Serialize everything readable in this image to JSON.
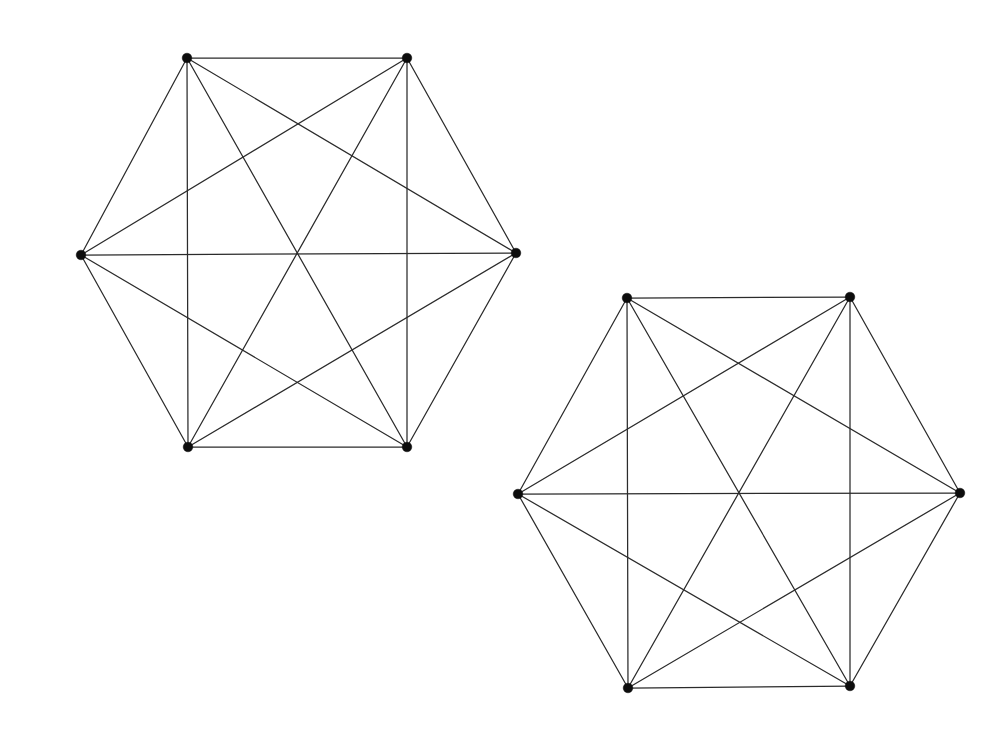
{
  "figure": {
    "background_color": "#ffffff",
    "edge_color": "#2b2b2b",
    "vertex_color": "#0d0d0d",
    "edge_width": 1.25,
    "vertex_radius": 4.8,
    "canvas": {
      "width": 987,
      "height": 739
    }
  },
  "graphs": [
    {
      "id": "graph-left",
      "name": "left-complete-graph-k6",
      "vertex_count": 6,
      "edge_count": 15,
      "degree": 5,
      "vertices": [
        {
          "id": "L0",
          "label": "top-left",
          "x": 187,
          "y": 58
        },
        {
          "id": "L1",
          "label": "top-right",
          "x": 407,
          "y": 58
        },
        {
          "id": "L2",
          "label": "right",
          "x": 516,
          "y": 253
        },
        {
          "id": "L3",
          "label": "bottom-right",
          "x": 407,
          "y": 447
        },
        {
          "id": "L4",
          "label": "bottom-left",
          "x": 188,
          "y": 447
        },
        {
          "id": "L5",
          "label": "left",
          "x": 81,
          "y": 255
        }
      ],
      "edges": [
        [
          0,
          1
        ],
        [
          0,
          2
        ],
        [
          0,
          3
        ],
        [
          0,
          4
        ],
        [
          0,
          5
        ],
        [
          1,
          2
        ],
        [
          1,
          3
        ],
        [
          1,
          4
        ],
        [
          1,
          5
        ],
        [
          2,
          3
        ],
        [
          2,
          4
        ],
        [
          2,
          5
        ],
        [
          3,
          4
        ],
        [
          3,
          5
        ],
        [
          4,
          5
        ]
      ]
    },
    {
      "id": "graph-right",
      "name": "right-complete-graph-k6",
      "vertex_count": 6,
      "edge_count": 15,
      "degree": 5,
      "vertices": [
        {
          "id": "R0",
          "label": "top-left",
          "x": 627,
          "y": 298
        },
        {
          "id": "R1",
          "label": "top-right",
          "x": 850,
          "y": 297
        },
        {
          "id": "R2",
          "label": "right",
          "x": 960,
          "y": 493
        },
        {
          "id": "R3",
          "label": "bottom-right",
          "x": 850,
          "y": 686
        },
        {
          "id": "R4",
          "label": "bottom-left",
          "x": 628,
          "y": 688
        },
        {
          "id": "R5",
          "label": "left",
          "x": 518,
          "y": 494
        }
      ],
      "edges": [
        [
          0,
          1
        ],
        [
          0,
          2
        ],
        [
          0,
          3
        ],
        [
          0,
          4
        ],
        [
          0,
          5
        ],
        [
          1,
          2
        ],
        [
          1,
          3
        ],
        [
          1,
          4
        ],
        [
          1,
          5
        ],
        [
          2,
          3
        ],
        [
          2,
          4
        ],
        [
          2,
          5
        ],
        [
          3,
          4
        ],
        [
          3,
          5
        ],
        [
          4,
          5
        ]
      ]
    }
  ]
}
